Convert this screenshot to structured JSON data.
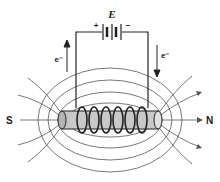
{
  "diagram": {
    "battery_label": "E",
    "battery_plus": "+",
    "battery_minus": "−",
    "left_electron_label": "e⁻",
    "right_electron_label": "e⁻",
    "south_pole_label": "S",
    "north_pole_label": "N",
    "colors": {
      "ink": "#222222",
      "field_lines": "#555555",
      "core": "#c8c8c8"
    }
  }
}
